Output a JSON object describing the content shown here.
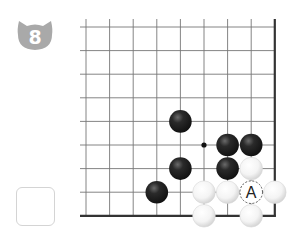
{
  "problem": {
    "number": "8",
    "badge_color": "#a9a9a9"
  },
  "board": {
    "origin_x": 86,
    "origin_y": 27,
    "spacing": 23.6,
    "columns": 9,
    "rows": 9,
    "edges": [
      "right",
      "bottom"
    ],
    "star_point": {
      "col": 5,
      "row": 5
    },
    "black_stones": [
      {
        "col": 4,
        "row": 4
      },
      {
        "col": 6,
        "row": 5
      },
      {
        "col": 7,
        "row": 5
      },
      {
        "col": 4,
        "row": 6
      },
      {
        "col": 6,
        "row": 6
      },
      {
        "col": 3,
        "row": 7
      }
    ],
    "white_stones": [
      {
        "col": 7,
        "row": 6
      },
      {
        "col": 5,
        "row": 7
      },
      {
        "col": 6,
        "row": 7
      },
      {
        "col": 8,
        "row": 7
      },
      {
        "col": 5,
        "row": 8
      },
      {
        "col": 7,
        "row": 8
      }
    ],
    "markers": [
      {
        "col": 7,
        "row": 7,
        "label": "A",
        "style": "dashed-circle"
      }
    ]
  },
  "answer_box": {
    "value": ""
  }
}
